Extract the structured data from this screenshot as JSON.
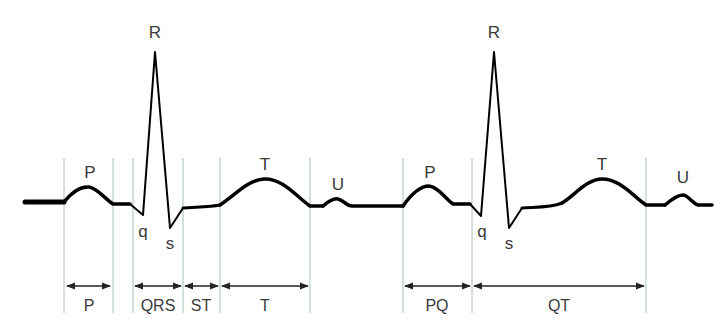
{
  "diagram": {
    "type": "ECG waveform",
    "colors": {
      "waveform": "#000000",
      "divider": "#a8bfc0",
      "label": "#3a3a3a",
      "background": "#ffffff"
    },
    "beats": [
      {
        "wave_labels": {
          "P": "P",
          "q": "q",
          "R": "R",
          "s": "s",
          "T": "T",
          "U": "U"
        },
        "intervals": [
          {
            "label": "P",
            "from_x": 64,
            "to_x": 113
          },
          {
            "label": "QRS",
            "from_x": 133,
            "to_x": 183
          },
          {
            "label": "ST",
            "from_x": 183,
            "to_x": 220
          },
          {
            "label": "T",
            "from_x": 220,
            "to_x": 310
          }
        ]
      },
      {
        "wave_labels": {
          "P": "P",
          "q": "q",
          "R": "R",
          "s": "s",
          "T": "T",
          "U": "U"
        },
        "intervals": [
          {
            "label": "PQ",
            "from_x": 403,
            "to_x": 472
          },
          {
            "label": "QT",
            "from_x": 472,
            "to_x": 646
          }
        ]
      }
    ]
  }
}
